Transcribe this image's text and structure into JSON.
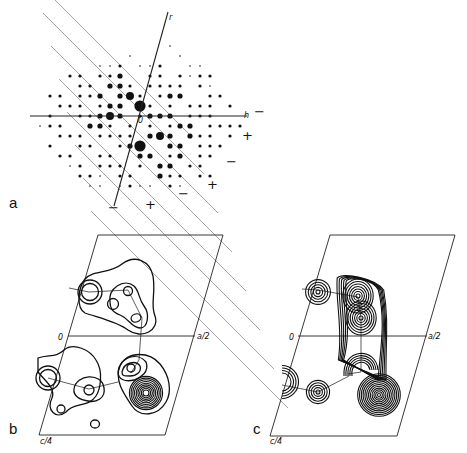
{
  "figure": {
    "panels": [
      {
        "id": "a",
        "label": "a",
        "kind": "diffraction-pattern",
        "axes": {
          "vertical": "r",
          "horizontal": "h",
          "origin": "0"
        },
        "sign_markers": [
          "−",
          "+",
          "−",
          "+",
          "−",
          "+",
          "−"
        ]
      },
      {
        "id": "b",
        "label": "b",
        "kind": "contour-map",
        "axes": {
          "origin": "0",
          "a_label": "a/2",
          "c_label": "c/4"
        }
      },
      {
        "id": "c",
        "label": "c",
        "kind": "contour-map",
        "axes": {
          "origin": "0",
          "a_label": "a/2",
          "c_label": "c/4"
        }
      }
    ]
  },
  "diffraction_spots": {
    "note": "intensity class per lattice node (0=absent,1=faint,2=small,3=medium,4=large,5=very large); rows top to bottom, columns left to right on a 10px lattice",
    "rows": [
      [
        0,
        0,
        0,
        0,
        0,
        0,
        0,
        0,
        0,
        0,
        0,
        0,
        0,
        1,
        0,
        0,
        0,
        0,
        0,
        0,
        0,
        0
      ],
      [
        0,
        0,
        0,
        0,
        0,
        0,
        0,
        0,
        0,
        1,
        0,
        0,
        0,
        0,
        1,
        0,
        0,
        0,
        0,
        0,
        0,
        0
      ],
      [
        0,
        0,
        0,
        0,
        0,
        0,
        1,
        1,
        2,
        0,
        1,
        1,
        2,
        0,
        0,
        1,
        1,
        0,
        0,
        0,
        0,
        0
      ],
      [
        0,
        0,
        0,
        2,
        2,
        0,
        2,
        2,
        3,
        0,
        0,
        2,
        2,
        0,
        2,
        1,
        2,
        2,
        0,
        0,
        0,
        0
      ],
      [
        0,
        0,
        0,
        0,
        2,
        2,
        0,
        3,
        3,
        2,
        0,
        2,
        2,
        2,
        2,
        0,
        2,
        1,
        0,
        0,
        0,
        0
      ],
      [
        0,
        2,
        2,
        0,
        2,
        2,
        3,
        0,
        3,
        4,
        2,
        0,
        2,
        3,
        3,
        0,
        0,
        2,
        2,
        0,
        0,
        0
      ],
      [
        0,
        0,
        2,
        2,
        2,
        0,
        2,
        3,
        3,
        0,
        5,
        2,
        0,
        2,
        0,
        2,
        2,
        2,
        0,
        2,
        0,
        0
      ],
      [
        0,
        2,
        0,
        0,
        2,
        2,
        3,
        4,
        3,
        0,
        2,
        3,
        3,
        3,
        0,
        2,
        2,
        2,
        0,
        0,
        0,
        0
      ],
      [
        1,
        2,
        2,
        0,
        0,
        3,
        3,
        2,
        0,
        2,
        0,
        2,
        0,
        2,
        3,
        3,
        0,
        2,
        2,
        2,
        2,
        0
      ],
      [
        0,
        0,
        2,
        2,
        2,
        0,
        2,
        2,
        2,
        2,
        0,
        3,
        4,
        3,
        0,
        3,
        2,
        2,
        0,
        2,
        0,
        0
      ],
      [
        0,
        2,
        0,
        0,
        2,
        2,
        0,
        0,
        2,
        3,
        5,
        0,
        0,
        3,
        3,
        0,
        2,
        2,
        2,
        0,
        0,
        0
      ],
      [
        0,
        0,
        2,
        2,
        0,
        0,
        2,
        2,
        0,
        0,
        3,
        3,
        0,
        2,
        3,
        0,
        2,
        2,
        0,
        0,
        0,
        0
      ],
      [
        0,
        0,
        0,
        1,
        2,
        0,
        2,
        2,
        2,
        0,
        2,
        0,
        3,
        3,
        0,
        2,
        2,
        0,
        0,
        0,
        0,
        0
      ],
      [
        0,
        0,
        0,
        0,
        2,
        2,
        1,
        0,
        2,
        2,
        0,
        0,
        3,
        2,
        2,
        0,
        2,
        2,
        0,
        0,
        0,
        0
      ],
      [
        0,
        0,
        0,
        0,
        0,
        1,
        1,
        0,
        1,
        2,
        1,
        1,
        0,
        2,
        1,
        0,
        0,
        0,
        0,
        0,
        0,
        0
      ]
    ]
  }
}
